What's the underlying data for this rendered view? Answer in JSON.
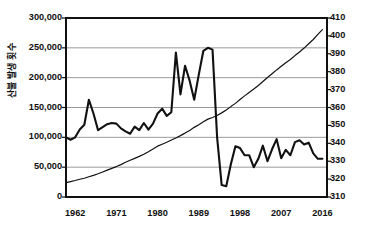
{
  "chart_data": {
    "type": "line",
    "title": "",
    "xlabel": "",
    "ylabel_left": "산불 발생 횟수",
    "ylabel_right": "",
    "grid": true,
    "legend_position": "none",
    "x_ticks": [
      "1962",
      "1971",
      "1980",
      "1989",
      "1998",
      "2007",
      "2016"
    ],
    "x_tick_years": [
      1962,
      1971,
      1980,
      1989,
      1998,
      2007,
      2016
    ],
    "xlim": [
      1960,
      2017
    ],
    "y_left_ticks": [
      "0",
      "50,000",
      "100,000",
      "150,000",
      "200,000",
      "250,000",
      "300,000"
    ],
    "y_left_values": [
      0,
      50000,
      100000,
      150000,
      200000,
      250000,
      300000
    ],
    "ylim_left": [
      0,
      300000
    ],
    "y_right_ticks": [
      "310",
      "320",
      "330",
      "340",
      "350",
      "360",
      "370",
      "380",
      "390",
      "400",
      "410"
    ],
    "y_right_values": [
      310,
      320,
      330,
      340,
      350,
      360,
      370,
      380,
      390,
      400,
      410
    ],
    "ylim_right": [
      310,
      410
    ],
    "x": [
      1960,
      1961,
      1962,
      1963,
      1964,
      1965,
      1966,
      1967,
      1968,
      1969,
      1970,
      1971,
      1972,
      1973,
      1974,
      1975,
      1976,
      1977,
      1978,
      1979,
      1980,
      1981,
      1982,
      1983,
      1984,
      1985,
      1986,
      1987,
      1988,
      1989,
      1990,
      1991,
      1992,
      1993,
      1994,
      1995,
      1996,
      1997,
      1998,
      1999,
      2000,
      2001,
      2002,
      2003,
      2004,
      2005,
      2006,
      2007,
      2008,
      2009,
      2010,
      2011,
      2012,
      2013,
      2014,
      2015,
      2016
    ],
    "series": [
      {
        "name": "산불 발생 횟수",
        "axis": "left",
        "color": "#111111",
        "width": 2.1,
        "values": [
          100000,
          96000,
          100000,
          113000,
          121000,
          163000,
          140000,
          112000,
          117000,
          122000,
          124000,
          123000,
          115000,
          110000,
          106000,
          118000,
          112000,
          124000,
          113000,
          123000,
          140000,
          148000,
          136000,
          142000,
          242000,
          172000,
          220000,
          195000,
          163000,
          205000,
          245000,
          250000,
          247000,
          100000,
          20000,
          18000,
          55000,
          85000,
          82000,
          70000,
          70000,
          50000,
          64000,
          86000,
          60000,
          80000,
          97000,
          65000,
          79000,
          70000,
          92000,
          95000,
          88000,
          91000,
          73000,
          64000,
          64000
        ],
        "note": "Left-axis series: forest fire occurrences; steep decline after 1992."
      },
      {
        "name": "CO2",
        "axis": "right",
        "color": "#111111",
        "width": 1.2,
        "values": [
          318.0,
          318.6,
          319.2,
          319.9,
          320.5,
          321.3,
          322.1,
          323.0,
          324.0,
          325.0,
          326.0,
          327.0,
          328.1,
          329.4,
          330.5,
          331.6,
          332.7,
          333.9,
          335.3,
          336.8,
          338.4,
          339.5,
          340.6,
          341.8,
          343.0,
          344.3,
          345.7,
          347.2,
          348.9,
          350.4,
          352.0,
          353.5,
          354.4,
          355.5,
          357.0,
          358.6,
          360.5,
          362.3,
          364.5,
          366.5,
          368.4,
          370.3,
          372.3,
          374.5,
          376.8,
          378.9,
          381.0,
          383.0,
          385.0,
          386.8,
          389.0,
          391.0,
          393.2,
          395.6,
          398.0,
          400.8,
          403.5
        ],
        "note": "Right-axis series: smooth monotonic rise, atmospheric ppm scale 310-410."
      }
    ]
  },
  "plot": {
    "left": 66,
    "top": 18,
    "right": 327,
    "bottom": 197,
    "frame_color": "#111111",
    "frame_width": 2,
    "grid_color": "#808080",
    "grid_width": 0.8,
    "background": "#ffffff"
  }
}
